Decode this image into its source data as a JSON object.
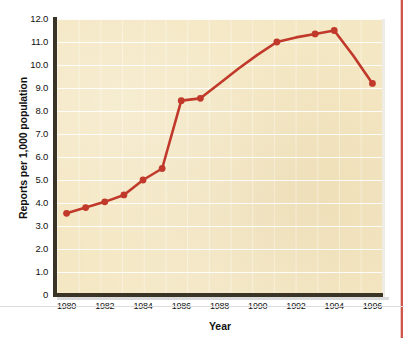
{
  "figure": {
    "title_ghost": "",
    "background_color": "#ffffff",
    "plot_background_color": "#f4e7c3",
    "line_color": "#c0392b",
    "axis_color": "#3a3427",
    "gridline_color": "#ffffff"
  },
  "axes": {
    "ylabel": "Reports per 1,000 population",
    "xlabel": "Year",
    "yticks": [
      "12.0",
      "11.0",
      "10.0",
      "9.0",
      "8.0",
      "7.0",
      "6.0",
      "5.0",
      "4.0",
      "3.0",
      "2.0",
      "1.0",
      "0"
    ],
    "xticks": [
      "1980",
      "1982",
      "1984",
      "1986",
      "1988",
      "1990",
      "1992",
      "1994",
      "1996"
    ]
  },
  "chart_data": {
    "type": "line",
    "title": "",
    "xlabel": "Year",
    "ylabel": "Reports per 1,000 population",
    "xlim": [
      1979.5,
      1996.5
    ],
    "ylim": [
      0,
      12
    ],
    "ytick_values": [
      0,
      1,
      2,
      3,
      4,
      5,
      6,
      7,
      8,
      9,
      10,
      11,
      12
    ],
    "xtick_values": [
      1980,
      1982,
      1984,
      1986,
      1988,
      1990,
      1992,
      1994,
      1996
    ],
    "grid": "horizontal",
    "legend": "none",
    "marker": "circle",
    "series": [
      {
        "name": "Reports per 1,000 population",
        "color": "#c0392b",
        "x": [
          1980,
          1981,
          1982,
          1983,
          1984,
          1985,
          1986,
          1987,
          1988,
          1989,
          1990,
          1991,
          1992,
          1993,
          1994,
          1995,
          1996
        ],
        "values": [
          3.55,
          3.8,
          4.05,
          4.35,
          5.0,
          5.5,
          8.45,
          8.55,
          9.2,
          9.85,
          10.45,
          11.0,
          11.2,
          11.35,
          11.5,
          10.4,
          9.2
        ],
        "marker_at": [
          1980,
          1981,
          1982,
          1983,
          1984,
          1985,
          1986,
          1987,
          1991,
          1993,
          1994,
          1996
        ]
      }
    ]
  }
}
